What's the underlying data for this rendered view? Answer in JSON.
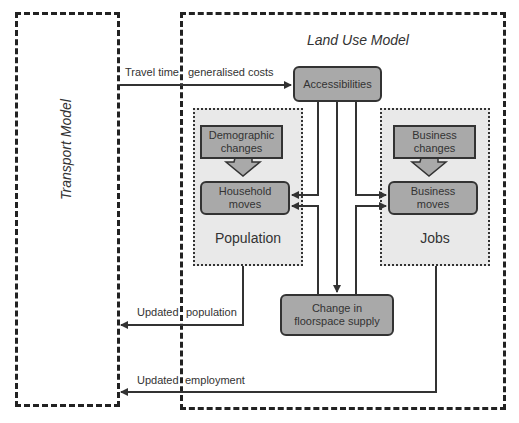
{
  "diagram": {
    "transport_model": {
      "title": "Transport Model"
    },
    "land_use_model": {
      "title": "Land Use Model"
    },
    "nodes": {
      "accessibilities": {
        "label": "Accessibilities"
      },
      "demographic_changes": {
        "line1": "Demographic",
        "line2": "changes"
      },
      "household_moves": {
        "line1": "Household",
        "line2": "moves"
      },
      "business_changes": {
        "line1": "Business",
        "line2": "changes"
      },
      "business_moves": {
        "line1": "Business",
        "line2": "moves"
      },
      "floorspace": {
        "line1": "Change in",
        "line2": "floorspace supply"
      }
    },
    "groups": {
      "population": {
        "title": "Population"
      },
      "jobs": {
        "title": "Jobs"
      }
    },
    "edge_labels": {
      "travel_time_left": "Travel time,",
      "travel_time_right": "generalised costs",
      "updated_population_left": "Updated",
      "updated_population_right": "population",
      "updated_employment_left": "Updated",
      "updated_employment_right": "employment"
    },
    "colors": {
      "box_fill": "#a9a9a9",
      "group_fill": "#e9e9e9",
      "line": "#333333"
    }
  }
}
